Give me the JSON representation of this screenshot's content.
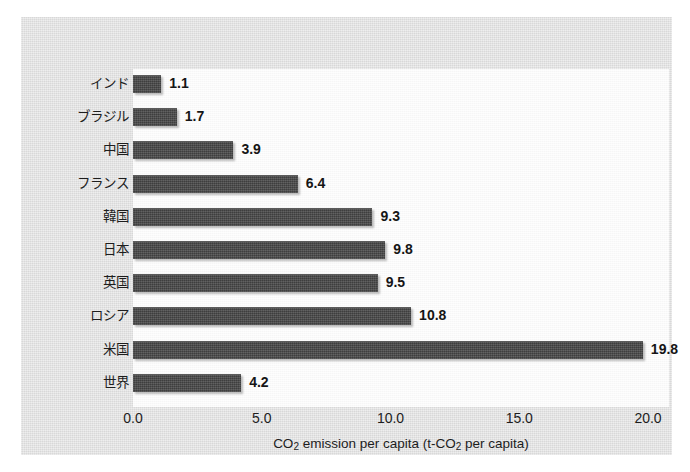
{
  "chart_data": {
    "type": "bar",
    "orientation": "horizontal",
    "title": "",
    "xlabel": "CO₂ emission per capita (t-CO₂ per capita)",
    "ylabel": "",
    "categories": [
      "インド",
      "ブラジル",
      "中国",
      "フランス",
      "韓国",
      "日本",
      "英国",
      "ロシア",
      "米国",
      "世界"
    ],
    "values": [
      1.1,
      1.7,
      3.9,
      6.4,
      9.3,
      9.8,
      9.5,
      10.8,
      19.8,
      4.2
    ],
    "value_labels": [
      "1.1",
      "1.7",
      "3.9",
      "6.4",
      "9.3",
      "9.8",
      "9.5",
      "10.8",
      "19.8",
      "4.2"
    ],
    "xlim": [
      0.0,
      20.8
    ],
    "xticks": [
      0.0,
      5.0,
      10.0,
      15.0,
      20.0
    ],
    "xtick_labels": [
      "0.0",
      "5.0",
      "10.0",
      "15.0",
      "20.0"
    ],
    "grid": false,
    "legend": null,
    "bar_color": "#4b4b4b",
    "plot_background": "#fbfbfb",
    "panel_background": "#dddddd"
  },
  "axis_title_parts": {
    "part1": "CO",
    "sub1": "2",
    "part2": " emission per capita (t-CO",
    "sub2": "2",
    "part3": " per capita)"
  }
}
